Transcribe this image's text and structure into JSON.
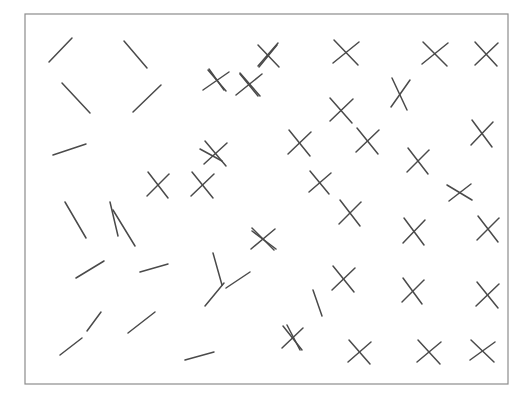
{
  "canvas": {
    "width": 530,
    "height": 406,
    "background_color": "#ffffff"
  },
  "frame": {
    "name": "stimulus-frame",
    "x": 25,
    "y": 14,
    "width": 483,
    "height": 370,
    "stroke_color": "#8c8c8c",
    "stroke_width": 1.2,
    "fill_color": "#ffffff"
  },
  "style": {
    "stroke_color": "#4a4a4a",
    "stroke_width": 1.5,
    "line_cap": "round"
  },
  "legend": {
    "distractor_label": "line segment",
    "target_label": "cross conjunction"
  },
  "chart_data": {
    "type": "scatter",
    "title": "",
    "xlabel": "",
    "ylabel": "",
    "xlim": [
      25,
      508
    ],
    "ylim": [
      14,
      384
    ],
    "grid": false,
    "legend_position": "none",
    "counts": {
      "lines": 24,
      "crosses": 28,
      "total_items": 52
    },
    "items": [
      {
        "kind": "line",
        "id": "line-01",
        "strokes": [
          [
            49,
            62,
            72,
            38
          ]
        ]
      },
      {
        "kind": "line",
        "id": "line-02",
        "strokes": [
          [
            124,
            41,
            147,
            68
          ]
        ]
      },
      {
        "kind": "line",
        "id": "line-03",
        "strokes": [
          [
            62,
            83,
            90,
            113
          ]
        ]
      },
      {
        "kind": "line",
        "id": "line-04",
        "strokes": [
          [
            133,
            112,
            161,
            85
          ]
        ]
      },
      {
        "kind": "line",
        "id": "line-05",
        "strokes": [
          [
            53,
            155,
            86,
            144
          ]
        ]
      },
      {
        "kind": "line",
        "id": "line-06",
        "strokes": [
          [
            65,
            202,
            86,
            238
          ]
        ]
      },
      {
        "kind": "line",
        "id": "line-07",
        "strokes": [
          [
            113,
            210,
            135,
            246
          ]
        ]
      },
      {
        "kind": "line",
        "id": "line-08",
        "strokes": [
          [
            76,
            278,
            104,
            261
          ]
        ]
      },
      {
        "kind": "line",
        "id": "line-09",
        "strokes": [
          [
            128,
            333,
            155,
            312
          ]
        ]
      },
      {
        "kind": "line",
        "id": "line-10",
        "strokes": [
          [
            60,
            355,
            82,
            338
          ]
        ]
      },
      {
        "kind": "line",
        "id": "line-11",
        "strokes": [
          [
            185,
            360,
            214,
            352
          ]
        ]
      },
      {
        "kind": "line",
        "id": "line-12",
        "strokes": [
          [
            140,
            272,
            168,
            264
          ]
        ]
      },
      {
        "kind": "line",
        "id": "line-13",
        "strokes": [
          [
            205,
            306,
            224,
            283
          ]
        ]
      },
      {
        "kind": "line",
        "id": "line-14",
        "strokes": [
          [
            213,
            253,
            222,
            285
          ]
        ]
      },
      {
        "kind": "line",
        "id": "line-15",
        "strokes": [
          [
            226,
            288,
            250,
            272
          ]
        ]
      },
      {
        "kind": "line",
        "id": "line-16",
        "strokes": [
          [
            110,
            202,
            118,
            236
          ]
        ]
      },
      {
        "kind": "line",
        "id": "line-17",
        "strokes": [
          [
            200,
            149,
            222,
            161
          ]
        ]
      },
      {
        "kind": "line",
        "id": "line-18",
        "strokes": [
          [
            252,
            231,
            276,
            249
          ]
        ]
      },
      {
        "kind": "line",
        "id": "line-19",
        "strokes": [
          [
            313,
            290,
            322,
            316
          ]
        ]
      },
      {
        "kind": "line",
        "id": "line-20",
        "strokes": [
          [
            287,
            325,
            300,
            350
          ]
        ]
      },
      {
        "kind": "line",
        "id": "line-21",
        "strokes": [
          [
            259,
            67,
            277,
            45
          ]
        ]
      },
      {
        "kind": "line",
        "id": "line-22",
        "strokes": [
          [
            209,
            69,
            224,
            90
          ]
        ]
      },
      {
        "kind": "line",
        "id": "line-23",
        "strokes": [
          [
            240,
            74,
            258,
            96
          ]
        ]
      },
      {
        "kind": "line",
        "id": "line-24",
        "strokes": [
          [
            87,
            331,
            101,
            312
          ]
        ]
      },
      {
        "kind": "cross",
        "id": "cross-01",
        "strokes": [
          [
            208,
            70,
            226,
            91
          ],
          [
            203,
            90,
            229,
            72
          ]
        ]
      },
      {
        "kind": "cross",
        "id": "cross-02",
        "strokes": [
          [
            240,
            73,
            260,
            96
          ],
          [
            236,
            95,
            262,
            74
          ]
        ]
      },
      {
        "kind": "cross",
        "id": "cross-03",
        "strokes": [
          [
            258,
            66,
            278,
            43
          ],
          [
            258,
            45,
            279,
            67
          ]
        ]
      },
      {
        "kind": "cross",
        "id": "cross-04",
        "strokes": [
          [
            334,
            40,
            358,
            65
          ],
          [
            333,
            63,
            359,
            42
          ]
        ]
      },
      {
        "kind": "cross",
        "id": "cross-05",
        "strokes": [
          [
            423,
            42,
            447,
            66
          ],
          [
            422,
            64,
            448,
            43
          ]
        ]
      },
      {
        "kind": "cross",
        "id": "cross-06",
        "strokes": [
          [
            475,
            42,
            497,
            66
          ],
          [
            475,
            65,
            498,
            43
          ]
        ]
      },
      {
        "kind": "cross",
        "id": "cross-07",
        "strokes": [
          [
            392,
            78,
            407,
            110
          ],
          [
            391,
            107,
            410,
            80
          ]
        ]
      },
      {
        "kind": "cross",
        "id": "cross-08",
        "strokes": [
          [
            330,
            98,
            352,
            123
          ],
          [
            330,
            121,
            353,
            99
          ]
        ]
      },
      {
        "kind": "cross",
        "id": "cross-09",
        "strokes": [
          [
            472,
            120,
            492,
            147
          ],
          [
            471,
            145,
            493,
            122
          ]
        ]
      },
      {
        "kind": "cross",
        "id": "cross-10",
        "strokes": [
          [
            289,
            130,
            310,
            156
          ],
          [
            288,
            154,
            311,
            132
          ]
        ]
      },
      {
        "kind": "cross",
        "id": "cross-11",
        "strokes": [
          [
            205,
            141,
            226,
            166
          ],
          [
            204,
            164,
            227,
            143
          ]
        ]
      },
      {
        "kind": "cross",
        "id": "cross-12",
        "strokes": [
          [
            408,
            148,
            428,
            174
          ],
          [
            407,
            172,
            429,
            150
          ]
        ]
      },
      {
        "kind": "cross",
        "id": "cross-13",
        "strokes": [
          [
            148,
            172,
            168,
            198
          ],
          [
            147,
            196,
            169,
            174
          ]
        ]
      },
      {
        "kind": "cross",
        "id": "cross-14",
        "strokes": [
          [
            192,
            172,
            213,
            198
          ],
          [
            191,
            196,
            214,
            174
          ]
        ]
      },
      {
        "kind": "cross",
        "id": "cross-15",
        "strokes": [
          [
            310,
            171,
            329,
            194
          ],
          [
            309,
            192,
            331,
            173
          ]
        ]
      },
      {
        "kind": "cross",
        "id": "cross-16",
        "strokes": [
          [
            447,
            185,
            472,
            200
          ],
          [
            449,
            201,
            471,
            184
          ]
        ]
      },
      {
        "kind": "cross",
        "id": "cross-17",
        "strokes": [
          [
            340,
            200,
            360,
            226
          ],
          [
            339,
            224,
            361,
            202
          ]
        ]
      },
      {
        "kind": "cross",
        "id": "cross-18",
        "strokes": [
          [
            404,
            218,
            424,
            245
          ],
          [
            403,
            243,
            425,
            220
          ]
        ]
      },
      {
        "kind": "cross",
        "id": "cross-19",
        "strokes": [
          [
            478,
            216,
            498,
            242
          ],
          [
            477,
            240,
            499,
            218
          ]
        ]
      },
      {
        "kind": "cross",
        "id": "cross-20",
        "strokes": [
          [
            252,
            228,
            274,
            250
          ],
          [
            251,
            249,
            275,
            229
          ]
        ]
      },
      {
        "kind": "cross",
        "id": "cross-21",
        "strokes": [
          [
            333,
            266,
            354,
            292
          ],
          [
            332,
            290,
            355,
            268
          ]
        ]
      },
      {
        "kind": "cross",
        "id": "cross-22",
        "strokes": [
          [
            403,
            278,
            422,
            304
          ],
          [
            402,
            302,
            424,
            280
          ]
        ]
      },
      {
        "kind": "cross",
        "id": "cross-23",
        "strokes": [
          [
            477,
            282,
            498,
            308
          ],
          [
            476,
            306,
            499,
            284
          ]
        ]
      },
      {
        "kind": "cross",
        "id": "cross-24",
        "strokes": [
          [
            283,
            326,
            302,
            350
          ],
          [
            282,
            348,
            303,
            328
          ]
        ]
      },
      {
        "kind": "cross",
        "id": "cross-25",
        "strokes": [
          [
            349,
            340,
            370,
            364
          ],
          [
            348,
            362,
            371,
            342
          ]
        ]
      },
      {
        "kind": "cross",
        "id": "cross-26",
        "strokes": [
          [
            418,
            340,
            440,
            364
          ],
          [
            417,
            362,
            441,
            342
          ]
        ]
      },
      {
        "kind": "cross",
        "id": "cross-27",
        "strokes": [
          [
            471,
            340,
            494,
            362
          ],
          [
            470,
            360,
            495,
            342
          ]
        ]
      },
      {
        "kind": "cross",
        "id": "cross-28",
        "strokes": [
          [
            357,
            128,
            378,
            154
          ],
          [
            356,
            152,
            379,
            130
          ]
        ]
      }
    ]
  }
}
